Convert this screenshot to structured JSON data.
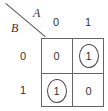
{
  "kmap": {
    "var_col": "A",
    "var_row": "B",
    "col_labels": [
      "0",
      "1"
    ],
    "row_labels": [
      "0",
      "1"
    ],
    "cells": [
      [
        {
          "value": "0",
          "circled": false
        },
        {
          "value": "1",
          "circled": true
        }
      ],
      [
        {
          "value": "1",
          "circled": true
        },
        {
          "value": "0",
          "circled": false
        }
      ]
    ]
  }
}
